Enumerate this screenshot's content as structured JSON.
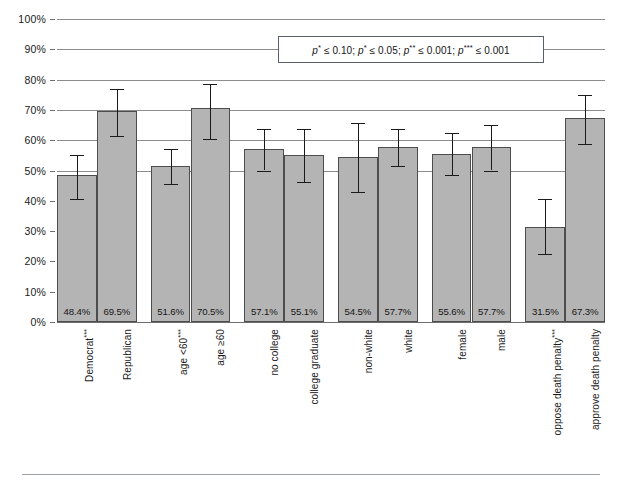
{
  "chart_data": {
    "type": "bar",
    "title": "",
    "subtitle": "",
    "xlabel": "",
    "ylabel": "",
    "ylim": [
      0,
      100
    ],
    "grid": true,
    "legend_position": "top-right-inset",
    "unit": "%",
    "categories": [
      "Democrat***",
      "Republican",
      "age <60***",
      "age ≥60",
      "no college",
      "college graduate",
      "non-white",
      "white",
      "female",
      "male",
      "oppose death penalty***",
      "approve death penalty"
    ],
    "values": [
      48.4,
      69.5,
      51.6,
      70.5,
      57.1,
      55.1,
      54.5,
      57.7,
      55.6,
      57.7,
      31.5,
      67.3
    ],
    "value_labels": [
      "48.4%",
      "69.5%",
      "51.6%",
      "70.5%",
      "57.1%",
      "55.1%",
      "54.5%",
      "57.7%",
      "55.6%",
      "57.7%",
      "31.5%",
      "67.3%"
    ],
    "error_low": [
      40.5,
      61.3,
      45.5,
      60.5,
      50.0,
      46.3,
      43.0,
      51.5,
      48.6,
      50.0,
      22.3,
      58.8
    ],
    "error_high": [
      55.0,
      77.0,
      57.0,
      78.5,
      63.8,
      63.7,
      65.8,
      63.8,
      62.4,
      65.0,
      40.7,
      74.9
    ],
    "ytick_labels": [
      "0%",
      "10%",
      "20%",
      "30%",
      "40%",
      "50%",
      "60%",
      "70%",
      "80%",
      "90%",
      "100%"
    ],
    "ytick_values": [
      0,
      10,
      20,
      30,
      40,
      50,
      60,
      70,
      80,
      90,
      100
    ],
    "groups": [
      {
        "name": "party",
        "members": [
          "Democrat***",
          "Republican"
        ]
      },
      {
        "name": "age",
        "members": [
          "age <60***",
          "age ≥60"
        ]
      },
      {
        "name": "education",
        "members": [
          "no college",
          "college graduate"
        ]
      },
      {
        "name": "race",
        "members": [
          "non-white",
          "white"
        ]
      },
      {
        "name": "gender",
        "members": [
          "female",
          "male"
        ]
      },
      {
        "name": "death-penalty",
        "members": [
          "oppose death penalty***",
          "approve death penalty"
        ]
      }
    ],
    "annotations": [
      {
        "name": "significance-note",
        "text": "p* ≤ 0.10; p* ≤ 0.05; p** ≤ 0.001; p*** ≤ 0.001",
        "parts": [
          {
            "p": "p",
            "sup": "*",
            "rel": "≤ 0.10;"
          },
          {
            "p": "p",
            "sup": "*",
            "rel": "≤ 0.05;"
          },
          {
            "p": "p",
            "sup": "**",
            "rel": "≤ 0.001;"
          },
          {
            "p": "p",
            "sup": "***",
            "rel": "≤ 0.001"
          }
        ]
      }
    ],
    "colors": {
      "bar_fill": "#b4b4b4",
      "bar_stroke": "#4d4d4d",
      "gridline": "#8c8c8c",
      "error_bar": "#1a1a1a",
      "text": "#1a1a1a",
      "background": "#ffffff",
      "note_border": "#59606b",
      "bottom_rule": "#9aa0a6"
    }
  }
}
